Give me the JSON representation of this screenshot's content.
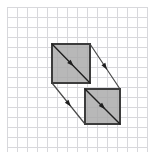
{
  "figure": {
    "canvas": {
      "width": 155,
      "height": 160,
      "background": "#ffffff"
    },
    "grid": {
      "label": "graph-paper-grid",
      "x0": 7,
      "y0": 7,
      "x1": 148,
      "y1": 152,
      "cell_size": 10,
      "line_color": "#d8d8dc",
      "line_width": 1,
      "columns": 14,
      "rows": 14,
      "visible": true
    },
    "shapes": [
      {
        "name": "preimage-square",
        "role": "preimage",
        "x": 52,
        "y": 44,
        "width": 38,
        "height": 39,
        "fill": "#a8a8a8",
        "stroke": "#3c3c3c",
        "stroke_width": 2
      },
      {
        "name": "image-square",
        "role": "image",
        "x": 85,
        "y": 89,
        "width": 35,
        "height": 35,
        "fill": "#a8a8a8",
        "stroke": "#3c3c3c",
        "stroke_width": 2
      }
    ],
    "vectors": {
      "label": "translation-vectors",
      "stroke": "#4a4a4a",
      "stroke_width": 1.2,
      "arrow_color": "#1e1e1e",
      "arrow_size": 4.5,
      "dx": 33,
      "dy": 42,
      "arrows": [
        {
          "name": "vector-top-right",
          "x1": 90,
          "y1": 44,
          "x2": 120,
          "y2": 89
        },
        {
          "name": "vector-through-preimage",
          "x1": 52,
          "y1": 44,
          "x2": 90,
          "y2": 83
        },
        {
          "name": "vector-bottom-left",
          "x1": 52,
          "y1": 83,
          "x2": 85,
          "y2": 124
        },
        {
          "name": "vector-through-image",
          "x1": 85,
          "y1": 89,
          "x2": 120,
          "y2": 124
        }
      ]
    }
  }
}
